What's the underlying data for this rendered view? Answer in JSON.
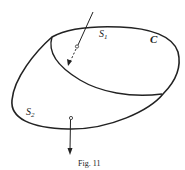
{
  "figure": {
    "caption": "Fig. 11",
    "labels": {
      "s1": "S",
      "s1_sub": "1",
      "s2": "S",
      "s2_sub": "2",
      "c": "C"
    },
    "colors": {
      "ink": "#222222",
      "background": "#ffffff"
    }
  }
}
